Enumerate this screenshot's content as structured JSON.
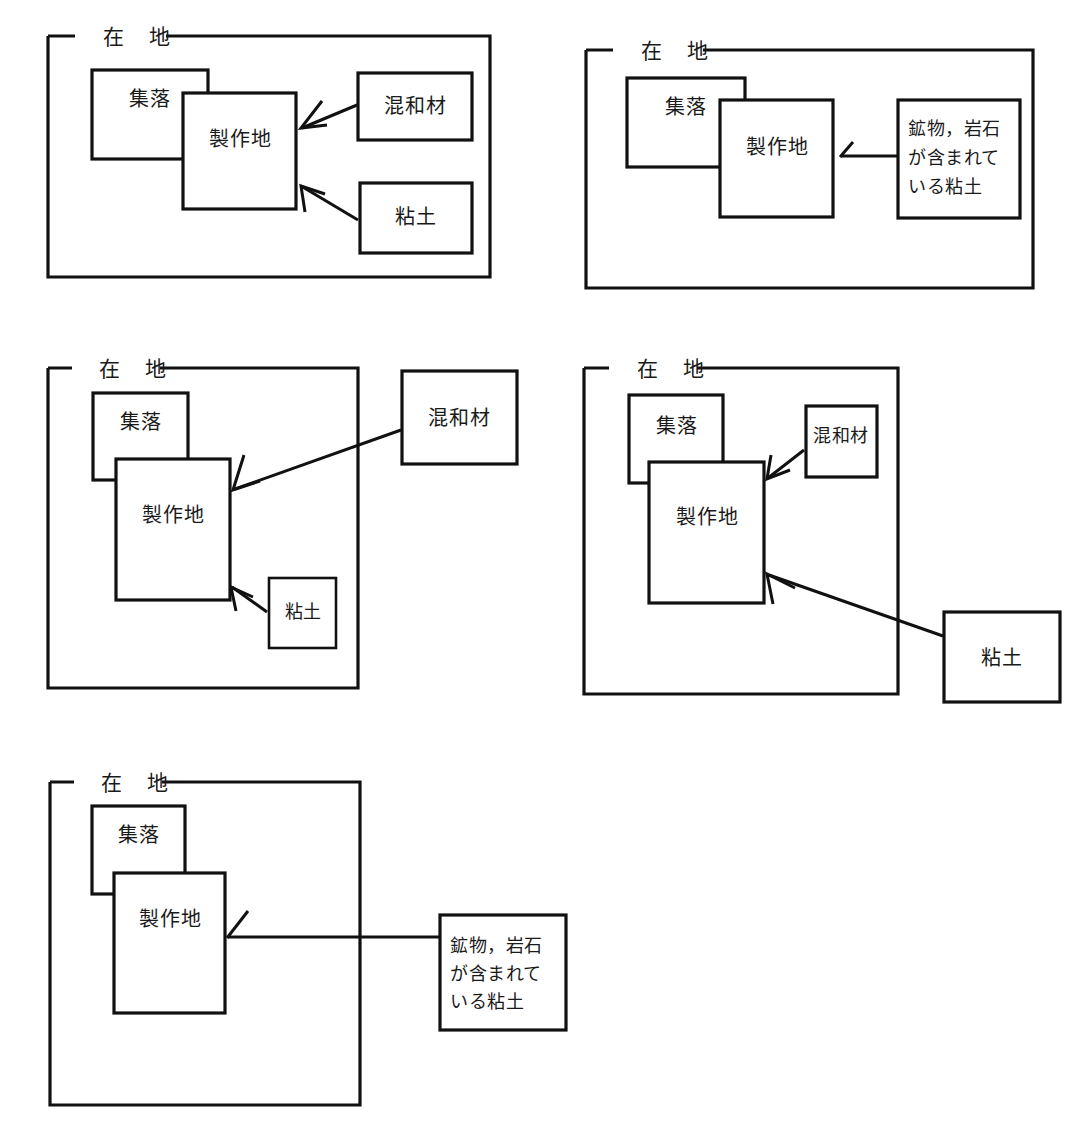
{
  "figure": {
    "caption": "",
    "panel_count": 5,
    "frame_label": "在 地",
    "colors": {
      "ink": "#111111",
      "paper": "#ffffff",
      "text": "#1a1a1a"
    },
    "panels": [
      {
        "id": "panel-1",
        "frame_label": "在 地",
        "settlement_label": "集落",
        "production_label": "製作地",
        "material_labels": [
          "混和材",
          "粘土"
        ],
        "materials_inside_frame": true
      },
      {
        "id": "panel-2",
        "frame_label": "在 地",
        "settlement_label": "集落",
        "production_label": "製作地",
        "material_labels": [
          "鉱物，岩石\nが含まれて\nいる粘土"
        ],
        "material_lines": [
          "鉱物，岩石",
          "が含まれて",
          "いる粘土"
        ],
        "materials_inside_frame": true
      },
      {
        "id": "panel-3",
        "frame_label": "在 地",
        "settlement_label": "集落",
        "production_label": "製作地",
        "material_labels": [
          "混和材",
          "粘土"
        ],
        "materials_inside_frame": false
      },
      {
        "id": "panel-4",
        "frame_label": "在 地",
        "settlement_label": "集落",
        "production_label": "製作地",
        "material_labels": [
          "混和材",
          "粘土"
        ],
        "materials_inside_frame": false
      },
      {
        "id": "panel-5",
        "frame_label": "在 地",
        "settlement_label": "集落",
        "production_label": "製作地",
        "material_labels": [
          "鉱物，岩石\nが含まれて\nいる粘土"
        ],
        "material_lines": [
          "鉱物，岩石",
          "が含まれて",
          "いる粘土"
        ],
        "materials_inside_frame": false
      }
    ],
    "text": {
      "zaichi": "在 地",
      "shuraku": "集落",
      "seisakuchi": "製作地",
      "konwazai": "混和材",
      "nendo": "粘土",
      "clay_line_1": "鉱物，岩石",
      "clay_line_2": "が含まれて",
      "clay_line_3": "いる粘土"
    }
  }
}
